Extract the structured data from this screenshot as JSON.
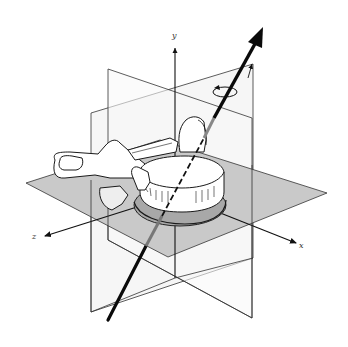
{
  "figure": {
    "axes": {
      "x_label": "x",
      "y_label": "y",
      "z_label": "z"
    },
    "rotation_symbol": "curved arrow around y axis",
    "colors": {
      "line": "#222222",
      "horizontal_plane_fill": "#c8c8c8",
      "vertical_plane_fill": "#f2f2f2",
      "bone_fill": "#ffffff",
      "main_arrow": "#0a0a0a",
      "main_arrow_occluded": "#777777"
    }
  }
}
